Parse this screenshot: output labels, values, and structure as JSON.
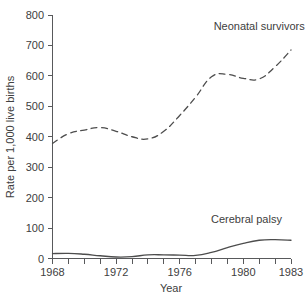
{
  "chart_data": {
    "type": "line",
    "title": "",
    "xlabel": "Year",
    "ylabel": "Rate per 1,000 live births",
    "xlim": [
      1968,
      1983
    ],
    "ylim": [
      0,
      800
    ],
    "grid": false,
    "legend_position": "inline-annotation",
    "x_ticks_labeled": [
      "1968",
      "1972",
      "1976",
      "1980",
      "1983"
    ],
    "x_ticks_all": [
      1968,
      1969,
      1970,
      1971,
      1972,
      1973,
      1974,
      1975,
      1976,
      1977,
      1978,
      1979,
      1980,
      1981,
      1982,
      1983
    ],
    "y_ticks": [
      "0",
      "100",
      "200",
      "300",
      "400",
      "500",
      "600",
      "700",
      "800"
    ],
    "x": [
      1968,
      1969,
      1970,
      1971,
      1972,
      1973,
      1974,
      1975,
      1976,
      1977,
      1978,
      1979,
      1980,
      1981,
      1982,
      1983
    ],
    "series": [
      {
        "name": "Neonatal survivors",
        "style": "dashed",
        "color": "#4d4d4d",
        "values": [
          378,
          410,
          422,
          430,
          418,
          400,
          393,
          418,
          470,
          530,
          597,
          605,
          592,
          590,
          630,
          685
        ]
      },
      {
        "name": "Cerebral palsy",
        "style": "solid",
        "color": "#4d4d4d",
        "values": [
          16,
          17,
          14,
          9,
          5,
          6,
          12,
          12,
          11,
          10,
          20,
          36,
          50,
          60,
          62,
          60
        ]
      }
    ],
    "annotations": [
      {
        "text": "Neonatal survivors",
        "x": 1981,
        "y": 750
      },
      {
        "text": "Cerebral palsy",
        "x": 1980.2,
        "y": 118
      }
    ]
  },
  "axes": {
    "x_title": "Year",
    "y_title": "Rate per 1,000 live births"
  }
}
